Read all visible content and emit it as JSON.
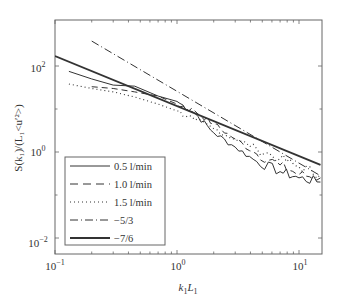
{
  "chart_data": {
    "type": "line",
    "title": "",
    "xlabel": "k1L1",
    "ylabel": "S(k1)/(L1<u'2>)",
    "xscale": "log",
    "yscale": "log",
    "xlim": [
      0.1,
      16
    ],
    "ylim": [
      0.008,
      350
    ],
    "grid": false,
    "legend_position": "lower left",
    "x_ticks": [
      "10^-1",
      "10^0",
      "10^1"
    ],
    "y_ticks": [
      "10^-2",
      "10^0",
      "10^2"
    ],
    "legend": [
      "0.5 l/min",
      "1.0 l/min",
      "1.5 l/min",
      "-5/3",
      "-7/6"
    ],
    "series": [
      {
        "name": "0.5 l/min",
        "style": "solid-thin",
        "x": [
          0.13,
          0.2,
          0.3,
          0.45,
          0.7,
          1.0,
          1.4,
          2.0,
          3.0,
          4.5,
          7.0,
          10,
          15
        ],
        "y": [
          75,
          50,
          36,
          34,
          20,
          15,
          8,
          2.8,
          1.3,
          0.6,
          0.35,
          0.25,
          0.2
        ]
      },
      {
        "name": "1.0 l/min",
        "style": "dashed",
        "x": [
          0.2,
          0.3,
          0.45,
          0.7,
          1.0,
          1.4,
          2.0,
          3.0,
          4.5,
          7.0,
          10,
          15
        ],
        "y": [
          33,
          30,
          25,
          20,
          13,
          9,
          4.5,
          2,
          0.9,
          0.5,
          0.3,
          0.25
        ]
      },
      {
        "name": "1.5 l/min",
        "style": "dotted",
        "x": [
          0.13,
          0.2,
          0.3,
          0.45,
          0.7,
          1.0,
          1.4,
          2.0,
          3.0,
          4.5,
          7.0,
          10,
          15
        ],
        "y": [
          38,
          30,
          25,
          19,
          13,
          9,
          5.5,
          3.5,
          2,
          1.2,
          0.7,
          0.45,
          0.3
        ]
      },
      {
        "name": "-5/3",
        "style": "dash-dot",
        "x": [
          0.2,
          15
        ],
        "y": [
          380,
          0.28
        ]
      },
      {
        "name": "-7/6",
        "style": "solid-thick",
        "x": [
          0.1,
          15
        ],
        "y": [
          170,
          0.5
        ]
      }
    ]
  },
  "axes": {
    "xlabel_main": "k",
    "xlabel_sub1": "1",
    "xlabel_main2": "L",
    "xlabel_sub2": "1",
    "ylabel": "S(k₁)/(L₁<u′²>)",
    "x_ticks": [
      {
        "base": "10",
        "exp": "−1"
      },
      {
        "base": "10",
        "exp": "0"
      },
      {
        "base": "10",
        "exp": "1"
      }
    ],
    "y_ticks": [
      {
        "base": "10",
        "exp": "2"
      },
      {
        "base": "10",
        "exp": "0"
      },
      {
        "base": "10",
        "exp": "−2"
      }
    ]
  },
  "legend": {
    "items": [
      {
        "label": "0.5 l/min"
      },
      {
        "label": "1.0 l/min"
      },
      {
        "label": "1.5 l/min"
      },
      {
        "label": "−5/3"
      },
      {
        "label": "−7/6"
      }
    ]
  },
  "colors": {
    "axis": "#555555",
    "line": "#333333"
  }
}
